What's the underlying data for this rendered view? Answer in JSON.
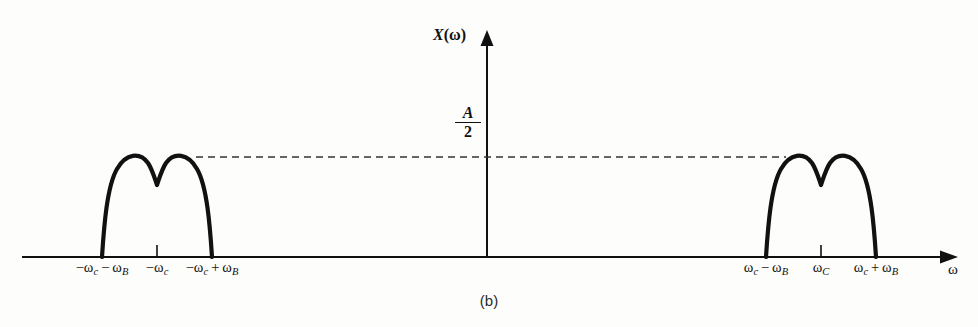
{
  "figure": {
    "caption": "(b)",
    "background": "#fdfdfb",
    "ink": "#111111",
    "y_axis": {
      "label_func": "X",
      "label_arg": "(ω)"
    },
    "x_axis": {
      "label": "ω"
    },
    "amplitude": {
      "numerator": "A",
      "denominator": "2",
      "value_text": "A/2"
    },
    "ticks": [
      {
        "id": "neg-wc-minus-wB",
        "x": 102,
        "omega": "−ω",
        "sub1": "c",
        "op": " − ",
        "omega2": "ω",
        "sub2": "B",
        "text": "−ωc − ωB"
      },
      {
        "id": "neg-wc",
        "x": 157,
        "omega": "−ω",
        "sub1": "c",
        "op": "",
        "omega2": "",
        "sub2": "",
        "text": "−ωc"
      },
      {
        "id": "neg-wc-plus-wB",
        "x": 212,
        "omega": "−ω",
        "sub1": "c",
        "op": " + ",
        "omega2": "ω",
        "sub2": "B",
        "text": "−ωc + ωB"
      },
      {
        "id": "wc-minus-wB",
        "x": 766,
        "omega": "ω",
        "sub1": "c",
        "op": " − ",
        "omega2": "ω",
        "sub2": "B",
        "text": "ωc − ωB"
      },
      {
        "id": "wc",
        "x": 821,
        "omega": "ω",
        "sub1": "C",
        "op": "",
        "omega2": "",
        "sub2": "",
        "text": "ωC"
      },
      {
        "id": "wc-plus-wB",
        "x": 876,
        "omega": "ω",
        "sub1": "c",
        "op": " + ",
        "omega2": "ω",
        "sub2": "B",
        "text": "ωc + ωB"
      }
    ]
  },
  "chart_data": {
    "type": "line",
    "title": "",
    "subtitle": "(b)",
    "xlabel": "ω",
    "ylabel": "X(ω)",
    "grid": false,
    "legend": null,
    "annotations": [
      {
        "text": "A/2",
        "type": "level-marker",
        "y": 0.5
      },
      {
        "text": "dashed level line from −ωc peak to +ωc peak",
        "type": "guide",
        "y": 0.5
      }
    ],
    "axis_notes": {
      "x_origin_px": 487,
      "baseline_px": 257,
      "peak_level_px": 157,
      "notch_level_px": 185,
      "x_arrow": "right",
      "y_arrow": "up"
    },
    "xtick_labels": [
      "−ωc − ωB",
      "−ωc",
      "−ωc + ωB",
      "ωc − ωB",
      "ωC",
      "ωc + ωB"
    ],
    "xtick_px": [
      102,
      157,
      212,
      766,
      821,
      876
    ],
    "ytick_labels": [
      "A/2"
    ],
    "ylim": [
      0,
      1.25
    ],
    "series": [
      {
        "name": "negative-band double-hump",
        "comment": "spectrum lobe centered at -wc, two rounded peaks at A/2 with V notch at center",
        "x_px": [
          102,
          112,
          122,
          133,
          145,
          157,
          169,
          181,
          192,
          202,
          212
        ],
        "y_level": [
          0,
          0.35,
          0.88,
          1.0,
          0.72,
          0.43,
          0.72,
          1.0,
          0.97,
          0.55,
          0
        ]
      },
      {
        "name": "positive-band double-hump",
        "comment": "spectrum lobe centered at +wc, mirror of negative band",
        "x_px": [
          766,
          776,
          786,
          797,
          809,
          821,
          833,
          845,
          856,
          866,
          876
        ],
        "y_level": [
          0,
          0.35,
          0.88,
          1.0,
          0.72,
          0.43,
          0.72,
          1.0,
          0.97,
          0.55,
          0
        ]
      }
    ]
  }
}
